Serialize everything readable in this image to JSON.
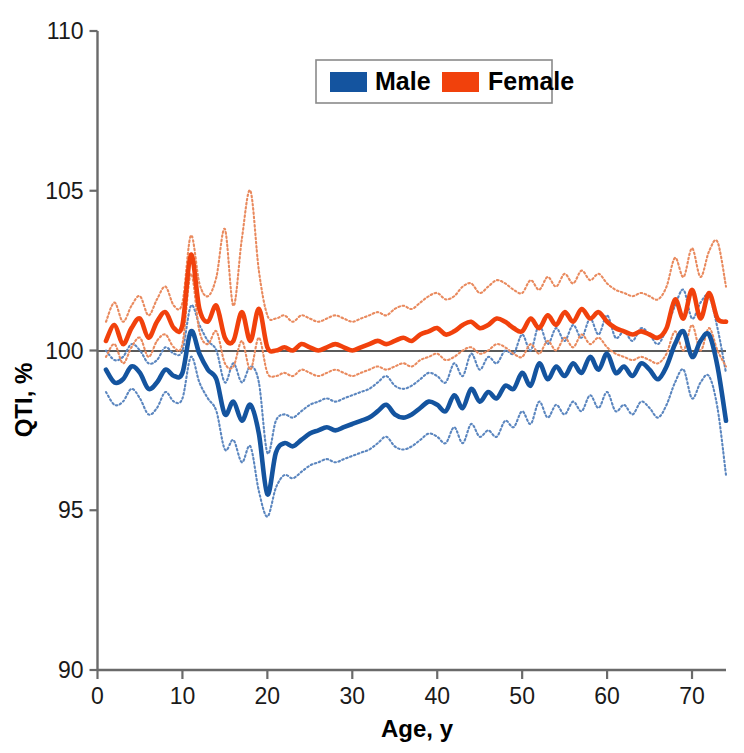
{
  "chart_data": {
    "type": "line",
    "title": "",
    "xlabel": "Age, y",
    "ylabel": "QTI, %",
    "xlim": [
      0,
      74
    ],
    "ylim": [
      90,
      110
    ],
    "xticks": [
      0,
      10,
      20,
      30,
      40,
      50,
      60,
      70
    ],
    "yticks": [
      90,
      95,
      100,
      105,
      110
    ],
    "grid": false,
    "reference_line": {
      "y": 100,
      "color": "#5a5a5a"
    },
    "legend": {
      "position": "top-center",
      "entries": [
        {
          "label": "Male",
          "color": "#14549f"
        },
        {
          "label": "Female",
          "color": "#f1410c"
        }
      ]
    },
    "x": [
      1,
      2,
      3,
      4,
      5,
      6,
      7,
      8,
      9,
      10,
      11,
      12,
      13,
      14,
      15,
      16,
      17,
      18,
      19,
      20,
      21,
      22,
      23,
      24,
      25,
      26,
      27,
      28,
      29,
      30,
      31,
      32,
      33,
      34,
      35,
      36,
      37,
      38,
      39,
      40,
      41,
      42,
      43,
      44,
      45,
      46,
      47,
      48,
      49,
      50,
      51,
      52,
      53,
      54,
      55,
      56,
      57,
      58,
      59,
      60,
      61,
      62,
      63,
      64,
      65,
      66,
      67,
      68,
      69,
      70,
      71,
      72,
      73,
      74
    ],
    "series": [
      {
        "name": "Male",
        "color": "#14549f",
        "style": "solid",
        "values": [
          99.4,
          99.0,
          99.1,
          99.5,
          99.3,
          98.8,
          99.0,
          99.4,
          99.2,
          99.3,
          100.6,
          99.9,
          99.4,
          99.1,
          98.0,
          98.4,
          97.8,
          98.3,
          97.4,
          95.5,
          96.8,
          97.1,
          97.0,
          97.2,
          97.4,
          97.5,
          97.6,
          97.5,
          97.6,
          97.7,
          97.8,
          97.9,
          98.1,
          98.3,
          98.0,
          97.9,
          98.0,
          98.2,
          98.4,
          98.3,
          98.1,
          98.6,
          98.2,
          98.8,
          98.4,
          98.7,
          98.5,
          98.9,
          98.8,
          99.3,
          98.9,
          99.6,
          99.1,
          99.5,
          99.2,
          99.6,
          99.3,
          99.8,
          99.4,
          99.9,
          99.3,
          99.5,
          99.2,
          99.6,
          99.4,
          99.1,
          99.5,
          100.2,
          100.6,
          99.8,
          100.3,
          100.5,
          99.5,
          97.8
        ]
      },
      {
        "name": "Male upper 95% CI",
        "color": "#5b86bf",
        "style": "dotted",
        "values": [
          100.0,
          99.7,
          99.8,
          100.2,
          100.0,
          99.6,
          99.7,
          100.1,
          99.9,
          100.0,
          101.4,
          100.8,
          100.3,
          100.0,
          99.0,
          99.6,
          99.0,
          99.5,
          99.0,
          96.8,
          97.8,
          98.0,
          97.9,
          98.1,
          98.3,
          98.4,
          98.5,
          98.4,
          98.5,
          98.6,
          98.7,
          98.8,
          99.0,
          99.2,
          98.9,
          98.8,
          98.9,
          99.1,
          99.3,
          99.2,
          99.0,
          99.6,
          99.2,
          99.9,
          99.4,
          99.8,
          99.6,
          100.0,
          99.9,
          100.5,
          100.0,
          100.8,
          100.2,
          100.7,
          100.3,
          100.8,
          100.4,
          101.0,
          100.5,
          101.1,
          100.4,
          100.6,
          100.3,
          100.7,
          100.5,
          100.2,
          100.7,
          101.4,
          101.9,
          101.0,
          101.5,
          101.7,
          100.7,
          99.3
        ]
      },
      {
        "name": "Male lower 95% CI",
        "color": "#5b86bf",
        "style": "dotted",
        "values": [
          98.7,
          98.3,
          98.4,
          98.8,
          98.5,
          98.0,
          98.2,
          98.7,
          98.4,
          98.5,
          99.8,
          99.0,
          98.5,
          98.1,
          96.9,
          97.2,
          96.5,
          97.0,
          95.6,
          94.8,
          95.7,
          96.1,
          96.0,
          96.2,
          96.4,
          96.5,
          96.6,
          96.5,
          96.6,
          96.7,
          96.8,
          96.9,
          97.1,
          97.3,
          97.0,
          96.9,
          97.0,
          97.2,
          97.4,
          97.3,
          97.1,
          97.6,
          97.1,
          97.7,
          97.3,
          97.5,
          97.3,
          97.8,
          97.6,
          98.1,
          97.7,
          98.4,
          97.9,
          98.3,
          98.0,
          98.4,
          98.1,
          98.6,
          98.2,
          98.7,
          98.1,
          98.3,
          98.0,
          98.4,
          98.2,
          97.9,
          98.3,
          99.0,
          99.4,
          98.5,
          99.0,
          99.2,
          98.2,
          96.1
        ]
      },
      {
        "name": "Female",
        "color": "#f1410c",
        "style": "solid",
        "values": [
          100.3,
          100.8,
          100.2,
          100.7,
          101.0,
          100.4,
          100.9,
          101.2,
          100.7,
          100.8,
          103.0,
          101.3,
          100.9,
          101.4,
          100.4,
          100.3,
          101.2,
          100.3,
          101.3,
          100.1,
          100.0,
          100.1,
          100.0,
          100.2,
          100.1,
          100.0,
          100.1,
          100.2,
          100.1,
          100.0,
          100.1,
          100.2,
          100.3,
          100.2,
          100.3,
          100.4,
          100.3,
          100.5,
          100.6,
          100.7,
          100.5,
          100.6,
          100.8,
          100.9,
          100.7,
          100.8,
          101.0,
          100.9,
          100.7,
          100.6,
          101.0,
          100.7,
          101.1,
          100.8,
          101.2,
          100.9,
          101.3,
          101.0,
          101.2,
          100.9,
          100.7,
          100.6,
          100.5,
          100.6,
          100.5,
          100.4,
          100.7,
          101.6,
          101.0,
          101.9,
          101.0,
          101.8,
          101.0,
          100.9
        ]
      },
      {
        "name": "Female upper 95% CI",
        "color": "#e98a5e",
        "style": "dotted",
        "values": [
          100.9,
          101.5,
          100.9,
          101.4,
          101.7,
          101.1,
          101.6,
          102.0,
          101.4,
          101.5,
          103.6,
          102.1,
          101.7,
          102.3,
          103.8,
          101.4,
          103.5,
          105.0,
          102.5,
          101.1,
          101.0,
          101.1,
          100.9,
          101.1,
          101.0,
          100.9,
          101.0,
          101.1,
          101.0,
          100.9,
          101.0,
          101.1,
          101.2,
          101.1,
          101.3,
          101.4,
          101.3,
          101.5,
          101.7,
          101.8,
          101.6,
          101.7,
          102.0,
          102.1,
          101.8,
          102.0,
          102.2,
          102.1,
          101.9,
          101.8,
          102.2,
          101.9,
          102.3,
          102.0,
          102.4,
          102.1,
          102.5,
          102.2,
          102.4,
          102.1,
          101.9,
          101.8,
          101.7,
          101.8,
          101.7,
          101.6,
          102.0,
          102.9,
          102.3,
          103.2,
          102.3,
          103.1,
          103.4,
          102.0
        ]
      },
      {
        "name": "Female lower 95% CI",
        "color": "#e98a5e",
        "style": "dotted",
        "values": [
          99.8,
          100.2,
          99.6,
          100.1,
          100.4,
          99.8,
          100.3,
          100.5,
          100.1,
          100.2,
          102.4,
          100.6,
          100.2,
          100.6,
          99.6,
          99.5,
          100.3,
          99.4,
          100.4,
          99.3,
          99.2,
          99.3,
          99.2,
          99.4,
          99.3,
          99.2,
          99.3,
          99.4,
          99.3,
          99.2,
          99.3,
          99.4,
          99.5,
          99.4,
          99.5,
          99.6,
          99.5,
          99.7,
          99.8,
          99.9,
          99.7,
          99.8,
          100.0,
          100.1,
          99.9,
          100.0,
          100.2,
          100.1,
          99.9,
          99.8,
          100.2,
          99.9,
          100.3,
          100.0,
          100.4,
          100.1,
          100.5,
          100.2,
          100.4,
          100.1,
          99.9,
          99.8,
          99.7,
          99.8,
          99.7,
          99.6,
          99.9,
          100.6,
          100.0,
          100.8,
          100.0,
          100.7,
          100.0,
          99.5
        ]
      }
    ]
  },
  "axes": {
    "xlabel": "Age, y",
    "ylabel": "QTI, %",
    "xtick_labels": [
      "0",
      "10",
      "20",
      "30",
      "40",
      "50",
      "60",
      "70"
    ],
    "ytick_labels": [
      "90",
      "95",
      "100",
      "105",
      "110"
    ]
  },
  "legend": {
    "male_label": "Male",
    "female_label": "Female",
    "male_color": "#14549f",
    "female_color": "#f1410c"
  }
}
